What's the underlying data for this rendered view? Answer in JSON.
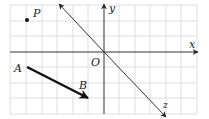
{
  "figure": {
    "type": "coordinate-grid-diagram",
    "grid": {
      "spacing_px": 15.5,
      "color": "#cfcfcf",
      "x_lines": [
        10,
        26,
        42,
        57,
        73,
        88,
        104,
        119,
        135,
        150,
        166,
        181,
        197
      ],
      "y_lines": [
        5,
        21,
        36,
        52,
        67,
        83,
        98,
        114
      ]
    },
    "axes": {
      "x": {
        "label": "x",
        "color": "#333333"
      },
      "y": {
        "label": "y",
        "color": "#333333"
      },
      "z": {
        "label": "z",
        "color": "#333333"
      },
      "origin": {
        "label": "O"
      }
    },
    "points": [
      {
        "name": "P",
        "label": "P"
      }
    ],
    "vectors": [
      {
        "from": "A",
        "to": "B",
        "from_label": "A",
        "to_label": "B",
        "color": "#111111"
      }
    ]
  }
}
